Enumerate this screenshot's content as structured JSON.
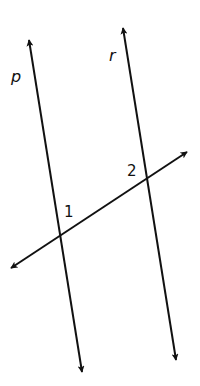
{
  "diagram": {
    "stroke_color": "#111111",
    "background_color": "#ffffff",
    "lines": [
      {
        "id": "p",
        "label": "p",
        "role": "parallel-line"
      },
      {
        "id": "r",
        "label": "r",
        "role": "parallel-line"
      },
      {
        "id": "t",
        "label": "",
        "role": "transversal"
      }
    ],
    "angle_labels": [
      {
        "id": "1",
        "text": "1",
        "at_intersection_of": [
          "p",
          "t"
        ]
      },
      {
        "id": "2",
        "text": "2",
        "at_intersection_of": [
          "r",
          "t"
        ]
      }
    ]
  }
}
